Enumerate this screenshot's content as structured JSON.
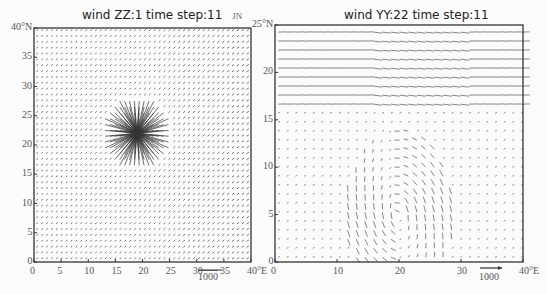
{
  "chart_data": [
    {
      "type": "vector_field",
      "title": "wind ZZ:1  time step:11",
      "annotation": "JN",
      "xlabel": "",
      "ylabel": "",
      "x_ticks": [
        "0",
        "5",
        "10",
        "15",
        "20",
        "25",
        "30",
        "35",
        "40°E"
      ],
      "y_ticks": [
        "0",
        "5",
        "10",
        "15",
        "20",
        "25",
        "30",
        "35",
        "40°N"
      ],
      "xlim": [
        0,
        40
      ],
      "ylim": [
        0,
        40
      ],
      "grid": false,
      "reference_vector": "1000",
      "description": "Uniform grid of small arrows; radially divergent circular pattern centered near (19E, 22N) with radius ~6 deg",
      "features": {
        "center": [
          19,
          22
        ],
        "radius": 6.5
      }
    },
    {
      "type": "vector_field",
      "title": "wind YY:22  time step:11",
      "xlabel": "",
      "ylabel": "",
      "x_ticks": [
        "0",
        "10",
        "20",
        "30",
        "40°E"
      ],
      "y_ticks": [
        "0",
        "5",
        "10",
        "15",
        "20",
        "25°N"
      ],
      "xlim": [
        0,
        40
      ],
      "ylim": [
        0,
        25
      ],
      "grid": false,
      "reference_vector": "1000",
      "description": "Strong westerly streamlines in upper band (17-25N); weak flow below with convergent/curved flow around 12-25E, 0-10N",
      "features": {
        "jet_band": [
          16,
          25
        ],
        "vortex_center": [
          20,
          5
        ]
      }
    }
  ],
  "left_plot": {
    "title": "wind ZZ:1  time step:11",
    "tag": "JN",
    "scale_label": "1000"
  },
  "right_plot": {
    "title": "wind YY:22  time step:11",
    "scale_label": "1000"
  }
}
